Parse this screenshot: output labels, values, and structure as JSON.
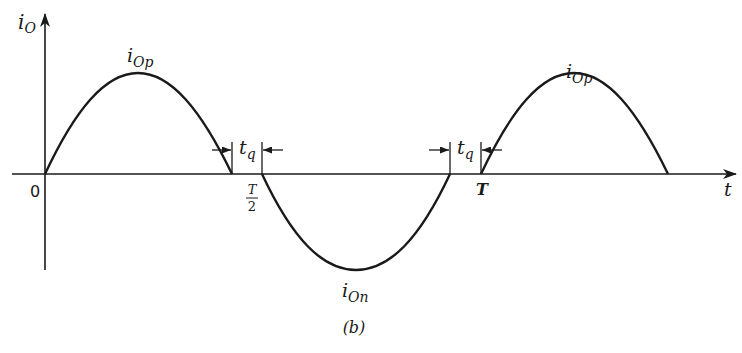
{
  "diagram": {
    "type": "waveform",
    "caption": "(b)",
    "y_axis": {
      "label_main": "i",
      "label_sub": "O"
    },
    "x_axis": {
      "label": "t",
      "origin_label": "0"
    },
    "tick_labels": {
      "half_period_num": "T",
      "half_period_den": "2",
      "period": "T"
    },
    "peaks": {
      "positive_1": {
        "main": "i",
        "sub": "Op"
      },
      "negative": {
        "main": "i",
        "sub": "On"
      },
      "positive_2": {
        "main": "i",
        "sub": "Op"
      }
    },
    "intervals": [
      {
        "main": "t",
        "sub": "q"
      },
      {
        "main": "t",
        "sub": "q"
      }
    ]
  },
  "colors": {
    "stroke": "#1a1a1a",
    "background": "#ffffff"
  }
}
